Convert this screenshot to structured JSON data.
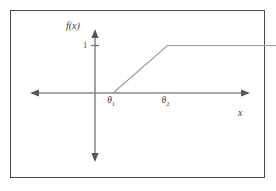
{
  "figure": {
    "caption_present": false,
    "background_color": "#ffffff",
    "frame_color": "#4a4a4e",
    "axis_color": "#8b8b8f",
    "curve_color": "#9a9a9e",
    "text_color": "#3f3f44"
  },
  "labels": {
    "y_axis": "f(x)",
    "x_axis": "x",
    "y_tick_one": "1",
    "theta1_symbol": "θ",
    "theta1_subscript": "1",
    "theta2_symbol": "θ",
    "theta2_subscript": "2"
  },
  "chart_data": {
    "type": "line",
    "title": "",
    "subtitle": "",
    "xlabel": "x",
    "ylabel": "f(x)",
    "xlim": [
      -1.55,
      2.9
    ],
    "ylim": [
      -1.2,
      1.45
    ],
    "grid": false,
    "legend": null,
    "x_tick_labels": [
      "θ1",
      "θ2"
    ],
    "x_tick_values": [
      0.25,
      1.0
    ],
    "y_tick_labels": [
      "1"
    ],
    "y_tick_values": [
      1
    ],
    "series": [
      {
        "name": "f(x)",
        "x": [
          0.25,
          1.0,
          2.62
        ],
        "y": [
          0,
          1,
          1
        ],
        "style": "solid",
        "color": "#9a9a9e"
      }
    ],
    "annotations": [
      {
        "text": "θ1",
        "x": 0.25,
        "y": 0,
        "placement": "below-axis"
      },
      {
        "text": "θ2",
        "x": 1.0,
        "y": 0,
        "placement": "below-axis"
      },
      {
        "text": "1",
        "x": 0,
        "y": 1,
        "placement": "left-of-tick"
      },
      {
        "text": "f(x)",
        "x": 0,
        "y": 1.42,
        "placement": "above-y-axis"
      },
      {
        "text": "x",
        "x": 2.85,
        "y": 0,
        "placement": "right-of-axis"
      }
    ]
  }
}
